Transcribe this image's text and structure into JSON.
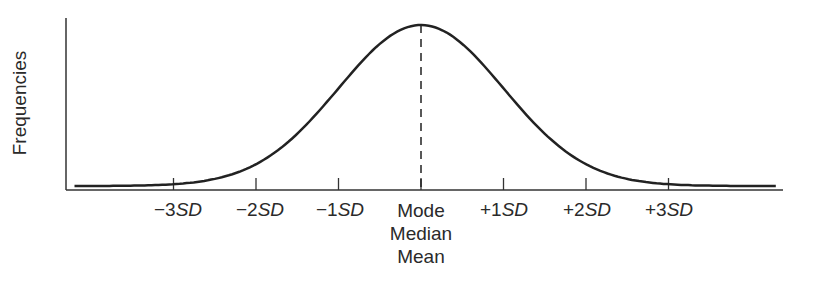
{
  "chart_data": {
    "type": "line",
    "title": "",
    "xlabel": "",
    "ylabel": "Frequencies",
    "x_ticks": [
      {
        "pos": -3,
        "prefix": "−3",
        "unit": "SD"
      },
      {
        "pos": -2,
        "prefix": "−2",
        "unit": "SD"
      },
      {
        "pos": -1,
        "prefix": "−1",
        "unit": "SD"
      },
      {
        "pos": 0,
        "lines": [
          "Mode",
          "Median",
          "Mean"
        ]
      },
      {
        "pos": 1,
        "prefix": "+1",
        "unit": "SD"
      },
      {
        "pos": 2,
        "prefix": "+2",
        "unit": "SD"
      },
      {
        "pos": 3,
        "prefix": "+3",
        "unit": "SD"
      }
    ],
    "x_range": [
      -4.2,
      4.3
    ],
    "curve": "normal pdf, mean 0, sd 1",
    "center_line": "dashed",
    "grid": false,
    "legend": null
  },
  "labels": {
    "ylabel": "Frequencies",
    "neg3": {
      "prefix": "−3",
      "unit": "SD"
    },
    "neg2": {
      "prefix": "−2",
      "unit": "SD"
    },
    "neg1": {
      "prefix": "−1",
      "unit": "SD"
    },
    "pos1": {
      "prefix": "+1",
      "unit": "SD"
    },
    "pos2": {
      "prefix": "+2",
      "unit": "SD"
    },
    "pos3": {
      "prefix": "+3",
      "unit": "SD"
    },
    "center": [
      "Mode",
      "Median",
      "Mean"
    ]
  }
}
